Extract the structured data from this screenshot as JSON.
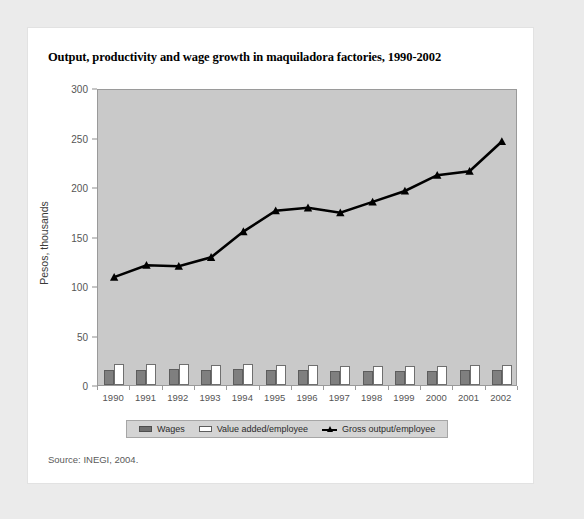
{
  "figure": {
    "title": "Output, productivity and wage growth in maquiladora factories, 1990-2002",
    "source": "Source: INEGI, 2004.",
    "colors": {
      "page_background": "#ebebeb",
      "card_background": "#ffffff",
      "plot_background": "#c9c9c9",
      "wages_fill": "#7f7f7f",
      "value_added_fill": "#ffffff",
      "gross_output_line": "#000000",
      "legend_background": "#d4d4d4",
      "axis": "#9a9a9a"
    }
  },
  "chart_data": {
    "type": "bar",
    "title": "Output, productivity and wage growth in maquiladora factories, 1990-2002",
    "subtitle": "",
    "xlabel": "",
    "ylabel": "Pesos, thousands",
    "categories": [
      "1990",
      "1991",
      "1992",
      "1993",
      "1994",
      "1995",
      "1996",
      "1997",
      "1998",
      "1999",
      "2000",
      "2001",
      "2002"
    ],
    "ylim": [
      0,
      300
    ],
    "yticks": [
      0,
      50,
      100,
      150,
      200,
      250,
      300
    ],
    "grid": false,
    "legend_position": "bottom",
    "series": [
      {
        "name": "Wages",
        "type": "bar",
        "color": "#7f7f7f",
        "values": [
          15,
          15,
          16,
          15,
          16,
          15,
          15,
          14,
          14,
          14,
          14,
          15,
          15
        ]
      },
      {
        "name": "Value added/employee",
        "type": "bar",
        "color": "#ffffff",
        "values": [
          21,
          21,
          21,
          20,
          21,
          20,
          20,
          19,
          19,
          19,
          19,
          20,
          20
        ]
      },
      {
        "name": "Gross output/employee",
        "type": "line",
        "color": "#000000",
        "marker": "triangle",
        "values": [
          111,
          123,
          122,
          131,
          157,
          178,
          181,
          176,
          187,
          198,
          214,
          218,
          248
        ]
      }
    ]
  }
}
